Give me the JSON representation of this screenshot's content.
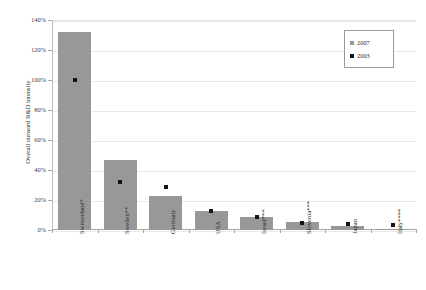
{
  "chart_data": {
    "type": "bar",
    "title": "",
    "xlabel": "",
    "ylabel": "Overall outward R&D intensity",
    "ylim": [
      0,
      140
    ],
    "ytick_labels": [
      "140%",
      "120%",
      "100%",
      "80%",
      "60%",
      "40%",
      "20%",
      "0%"
    ],
    "ytick_values": [
      140,
      120,
      100,
      80,
      60,
      40,
      20,
      0
    ],
    "grid": true,
    "legend_position": "top-right",
    "categories": [
      "Switzerland*",
      "Sweden**",
      "Germany",
      "USA",
      "Israel***",
      "Slovenia***",
      "Japan",
      "Italy****"
    ],
    "series": [
      {
        "name": "2007",
        "type": "bar",
        "color": "#989898",
        "values": [
          132,
          47,
          23,
          13,
          9,
          5.5,
          3,
          0.5
        ]
      },
      {
        "name": "2003",
        "type": "scatter",
        "color": "#141414",
        "values": [
          100,
          32,
          29,
          13,
          9,
          5,
          4,
          3.5
        ]
      }
    ]
  },
  "legend": {
    "items": [
      {
        "label": "2007",
        "color": "#989898"
      },
      {
        "label": "2003",
        "color": "#141414"
      }
    ]
  },
  "axis": {
    "y_title": "Overall outward R&D intensity"
  }
}
